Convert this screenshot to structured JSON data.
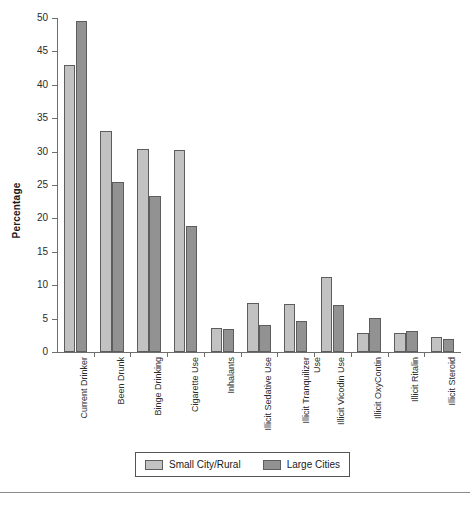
{
  "chart_data": {
    "type": "bar",
    "title": "",
    "xlabel": "",
    "ylabel": "Percentage",
    "ylim": [
      0,
      50
    ],
    "yticks": [
      0,
      5,
      10,
      15,
      20,
      25,
      30,
      35,
      40,
      45,
      50
    ],
    "ytick_labels": [
      "0",
      "5",
      "10",
      "15",
      "20",
      "25",
      "30",
      "35",
      "40",
      "45",
      "50"
    ],
    "grid": false,
    "legend_position": "bottom-center",
    "categories": [
      "Current Drinker",
      "Been Drunk",
      "Binge Drinking",
      "Cigarette Use",
      "Inhalants",
      "Illicit Sedative Use",
      "Illicit Tranquilizer Use",
      "Illicit Vicodin Use",
      "Illicit OxyContin",
      "Illicit Ritalin",
      "Illicit Steroid"
    ],
    "category_label_lines": [
      [
        "Current Drinker"
      ],
      [
        "Been Drunk"
      ],
      [
        "Binge Drinking"
      ],
      [
        "Cigarette Use"
      ],
      [
        "Inhalants"
      ],
      [
        "Illicit Sedative Use"
      ],
      [
        "Illicit Tranquilizer",
        "Use"
      ],
      [
        "Illicit Vicodin Use"
      ],
      [
        "Illicit OxyContin"
      ],
      [
        "Illicit Ritalin"
      ],
      [
        "Illicit Steroid"
      ]
    ],
    "series": [
      {
        "name": "Small City/Rural",
        "color": "#c2c2c2",
        "values": [
          43.0,
          33.1,
          30.4,
          30.3,
          3.6,
          7.3,
          7.2,
          11.2,
          2.8,
          2.9,
          2.2
        ]
      },
      {
        "name": "Large Cities",
        "color": "#929292",
        "values": [
          49.6,
          25.4,
          23.3,
          18.9,
          3.5,
          4.1,
          4.7,
          7.0,
          5.1,
          3.1,
          2.0
        ]
      }
    ]
  },
  "legend": {
    "items": [
      {
        "label": "Small City/Rural"
      },
      {
        "label": "Large Cities"
      }
    ]
  }
}
